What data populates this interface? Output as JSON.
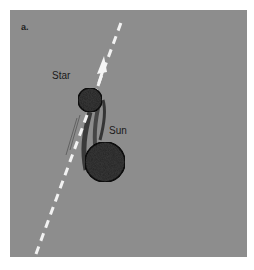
{
  "figure": {
    "panel_label": "a.",
    "labels": {
      "star": "Star",
      "sun": "Sun"
    },
    "colors": {
      "background": "#8d8d8d",
      "path_line": "#f2f2f2",
      "body_fill": "#3a3a3a",
      "body_outline": "#141414"
    },
    "elements": {
      "star_path": "dashed white line with arrow pointing up-right",
      "star": "small dark sphere with motion trail",
      "sun": "large dark sphere"
    }
  }
}
